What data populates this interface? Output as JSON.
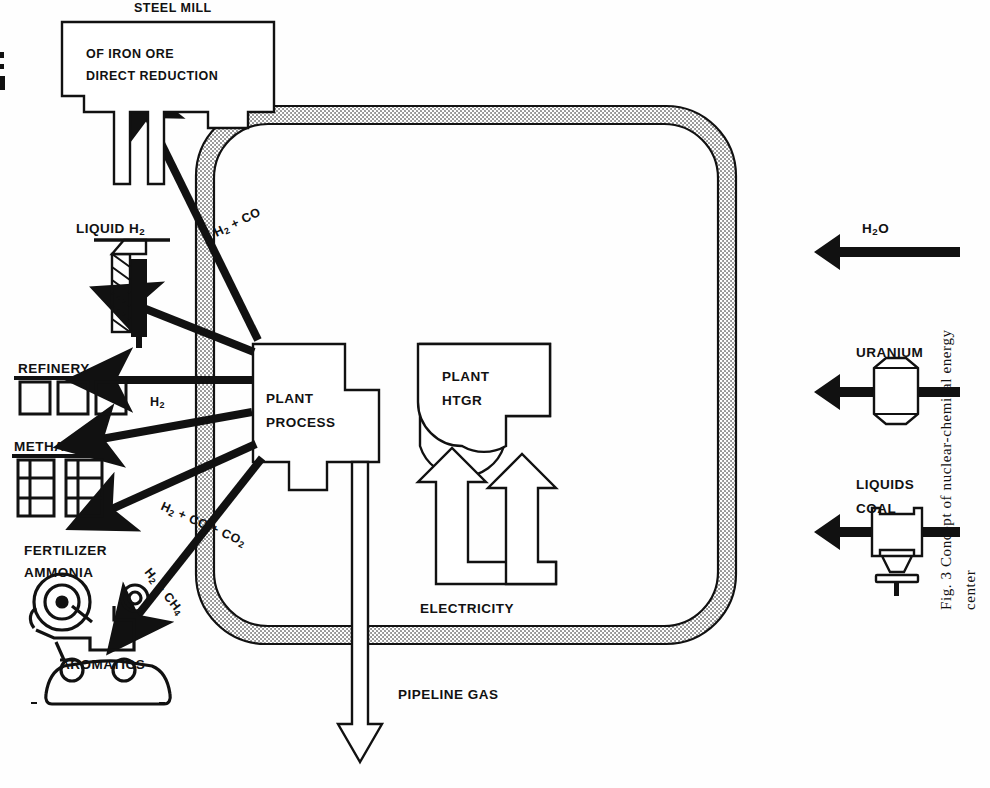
{
  "figure": {
    "caption_line1": "Fig. 3  Concept of nuclear-chemical energy",
    "caption_line2": "center",
    "rotation_note": "90"
  },
  "center": {
    "boundary_name": "energy-center-boundary",
    "plants": [
      {
        "id": "process-plant",
        "line1": "PROCESS",
        "line2": "PLANT"
      },
      {
        "id": "htgr-plant",
        "line1": "HTGR",
        "line2": "PLANT"
      }
    ],
    "electricity_label": "ELECTRICITY"
  },
  "inputs": [
    {
      "id": "coal-liquids",
      "line1": "COAL",
      "line2": "LIQUIDS",
      "icon": "valve-icon"
    },
    {
      "id": "uranium",
      "line1": "URANIUM",
      "line2": "",
      "icon": "fuel-pellet-icon"
    },
    {
      "id": "water",
      "line1": "H",
      "sub1": "2",
      "line2": "O",
      "icon": "none"
    }
  ],
  "pipeline_output": {
    "label": "PIPELINE GAS",
    "arrow": "hollow-arrow-left"
  },
  "products": [
    {
      "id": "aromatics",
      "title": "AROMATICS",
      "stream_main": "H",
      "stream_sub": "2",
      "stream_rest": " + CH",
      "stream_sub2": "4",
      "stream_label": "H2 + CH4",
      "icon": "car-icon"
    },
    {
      "id": "ammonia-fertilizer",
      "title": "AMMONIA",
      "title2": "FERTILIZER",
      "stream_label": "H2 + CO + CO2",
      "icon": "tractor-icon"
    },
    {
      "id": "methanol",
      "title": "METHANOL",
      "stream_label": "",
      "icon": "storage-buildings-icon"
    },
    {
      "id": "refinery",
      "title": "REFINERY",
      "stream_label": "H2",
      "icon": "tank-farm-icon"
    },
    {
      "id": "liquid-hydrogen",
      "title": "LIQUID H",
      "title_sub": "2",
      "stream_label": "",
      "icon": "tanker-truck-icon"
    },
    {
      "id": "steel-mill",
      "title": "DIRECT REDUCTION",
      "title2": "OF IRON ORE",
      "title3": "STEEL MILL",
      "stream_label": "H2 + CO",
      "icon": "factory-icon"
    }
  ],
  "stream_labels": {
    "aromatics": {
      "a": "H",
      "a_sub": "2",
      "b": " + CH",
      "b_sub": "4"
    },
    "ammonia": {
      "a": "H",
      "a_sub": "2",
      "b": " + CO + CO",
      "b_sub": "2"
    },
    "refinery": {
      "a": "H",
      "a_sub": "2",
      "b": "",
      "b_sub": ""
    },
    "steelmill": {
      "a": "H",
      "a_sub": "2",
      "b": " + CO",
      "b_sub": ""
    }
  },
  "colors": {
    "ink": "#111111",
    "paper": "#fefefe",
    "hatch": "#9a9a9a"
  }
}
